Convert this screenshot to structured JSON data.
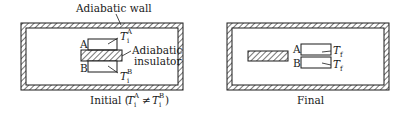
{
  "figure": {
    "panels": [
      {
        "id": "initial",
        "caption_prefix": "Initial (",
        "caption_suffix": ")",
        "caption_math": {
          "T": "T",
          "sub": "i",
          "supA": "A",
          "neq": "≠",
          "supB": "B"
        },
        "wall_label": "Adiabatic wall",
        "insulator_label_line1": "Adiabatic",
        "insulator_label_line2": "insulator",
        "block_a_label": "A",
        "block_b_label": "B",
        "temp_a": {
          "T": "T",
          "sub": "i",
          "sup": "A"
        },
        "temp_b": {
          "T": "T",
          "sub": "i",
          "sup": "B"
        }
      },
      {
        "id": "final",
        "caption": "Final",
        "block_a_label": "A",
        "block_b_label": "B",
        "temp_a": {
          "T": "T",
          "sub": "f"
        },
        "temp_b": {
          "T": "T",
          "sub": "f"
        }
      }
    ],
    "colors": {
      "line": "#1a1a1a",
      "background": "#ffffff"
    }
  }
}
